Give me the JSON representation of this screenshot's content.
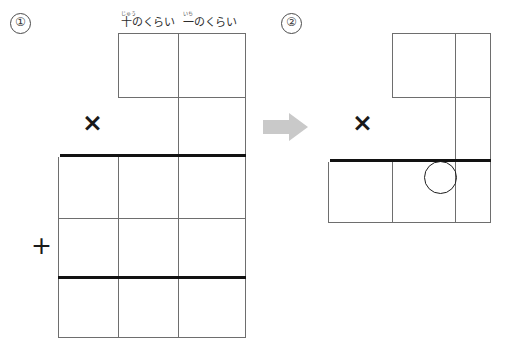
{
  "worksheet": {
    "type": "japanese-arithmetic-column-method",
    "steps": [
      {
        "id": "step-1",
        "marker": "①",
        "name": "before"
      },
      {
        "id": "step-2",
        "marker": "②",
        "name": "after"
      }
    ],
    "transition_arrow": "arrow-right-icon"
  },
  "place_labels": [
    {
      "id": "tens",
      "ruby": "じゅう",
      "base": "十のくらい",
      "meaning": "tens place"
    },
    {
      "id": "ones",
      "ruby": "いち",
      "base": "一のくらい",
      "meaning": "ones place"
    }
  ],
  "operators": {
    "multiply": "×",
    "plus": "+"
  },
  "colors": {
    "grid_line": "#6e6e6e",
    "rule_line": "#121212",
    "arrow": "#c9c9c9",
    "circle": "#1d1d1d",
    "text": "#2d2d2d",
    "background": "#ffffff"
  },
  "diagram_left": {
    "name": "step-1-column-layout",
    "rows": [
      {
        "name": "multiplicand-row",
        "cells": 2,
        "values": [
          "",
          ""
        ]
      },
      {
        "name": "multiplier-row",
        "cells": 1,
        "values": [
          ""
        ]
      },
      {
        "name": "partial-product-row",
        "cells": 3,
        "values": [
          "",
          "",
          ""
        ]
      },
      {
        "name": "addend-row",
        "cells": 3,
        "values": [
          "",
          "",
          ""
        ]
      },
      {
        "name": "total-row",
        "cells": 3,
        "values": [
          "",
          "",
          ""
        ]
      }
    ]
  },
  "diagram_right": {
    "name": "step-2-column-layout",
    "rows": [
      {
        "name": "multiplicand-row",
        "cells": 2,
        "values": [
          "",
          ""
        ]
      },
      {
        "name": "multiplier-row",
        "cells": 1,
        "values": [
          ""
        ]
      },
      {
        "name": "product-row",
        "cells": 3,
        "values": [
          "",
          "",
          ""
        ]
      }
    ],
    "highlight": {
      "name": "circled-cell",
      "target_row": "product-row",
      "target_column": "middle"
    }
  }
}
